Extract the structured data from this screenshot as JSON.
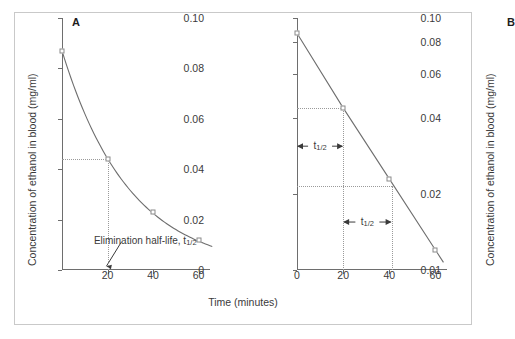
{
  "figure": {
    "x_axis_title": "Time (minutes)",
    "y_axis_title": "Concentration of ethanol in blood (mg/ml)"
  },
  "panels": [
    {
      "letter": "A",
      "scale": "linear",
      "y_ticks": [
        "0.10",
        "0.08",
        "0.06",
        "0.04",
        "0.02",
        "0"
      ],
      "x_ticks": [
        "20",
        "40",
        "60"
      ],
      "annotation": "Elimination half-life, t",
      "annotation_sub": "1/2"
    },
    {
      "letter": "B",
      "scale": "logarithmic",
      "y_ticks": [
        "0.10",
        "0.08",
        "0.06",
        "0.04",
        "0.02",
        "0.01"
      ],
      "x_ticks": [
        "0",
        "20",
        "40",
        "60"
      ],
      "thalf_label": "t",
      "thalf_sub": "1/2"
    }
  ],
  "chart_data": [
    {
      "type": "line",
      "title": "A",
      "xlabel": "Time (minutes)",
      "ylabel": "Concentration of ethanol in blood (mg/ml)",
      "x": [
        0,
        20,
        40,
        60
      ],
      "values": [
        0.087,
        0.044,
        0.023,
        0.012
      ],
      "xlim": [
        0,
        65
      ],
      "ylim": [
        0,
        0.1
      ],
      "yscale": "linear",
      "xticks": [
        20,
        40,
        60
      ],
      "yticks": [
        0,
        0.02,
        0.04,
        0.06,
        0.08,
        0.1
      ],
      "grid": false,
      "legend": "none",
      "annotations": [
        {
          "text": "Elimination half-life, t1/2",
          "points_to_x": 20,
          "points_to_y": 0
        }
      ],
      "guides": [
        {
          "type": "hline",
          "y": 0.044,
          "from_x": 0,
          "to_x": 20
        },
        {
          "type": "vline",
          "x": 20,
          "from_y": 0,
          "to_y": 0.044
        }
      ]
    },
    {
      "type": "line",
      "title": "B",
      "xlabel": "Time (minutes)",
      "ylabel": "Concentration of ethanol in blood (mg/ml)",
      "x": [
        0,
        20,
        40,
        60
      ],
      "values": [
        0.087,
        0.044,
        0.023,
        0.012
      ],
      "xlim": [
        0,
        65
      ],
      "ylim": [
        0.01,
        0.1
      ],
      "yscale": "log",
      "xticks": [
        0,
        20,
        40,
        60
      ],
      "yticks": [
        0.01,
        0.02,
        0.04,
        0.06,
        0.08,
        0.1
      ],
      "grid": false,
      "legend": "none",
      "annotations": [
        {
          "text": "t1/2",
          "span_x": [
            0,
            20
          ],
          "at_y": 0.031
        },
        {
          "text": "t1/2",
          "span_x": [
            20,
            41
          ],
          "at_y": 0.0155
        }
      ],
      "guides": [
        {
          "type": "hline",
          "y": 0.044,
          "from_x": 0,
          "to_x": 20
        },
        {
          "type": "vline",
          "x": 20,
          "from_y": 0.01,
          "to_y": 0.044
        },
        {
          "type": "hline",
          "y": 0.0215,
          "from_x": 0,
          "to_x": 41
        },
        {
          "type": "vline",
          "x": 41,
          "from_y": 0.01,
          "to_y": 0.0215
        }
      ]
    }
  ]
}
